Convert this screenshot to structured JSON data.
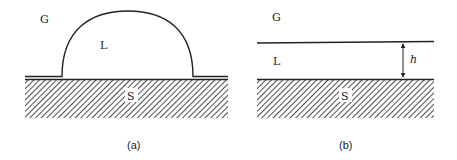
{
  "figure": {
    "panels": [
      {
        "id": "a",
        "caption": "(a)",
        "labels": {
          "gas": "G",
          "liquid": "L",
          "solid": "S"
        },
        "description": "Liquid droplet (L) sitting on a hatched solid substrate (S) in gas (G), with thin precursor film on either side"
      },
      {
        "id": "b",
        "caption": "(b)",
        "labels": {
          "gas": "G",
          "liquid": "L",
          "solid": "S",
          "thickness": "h"
        },
        "description": "Flat liquid film (L) of thickness h on a hatched solid substrate (S) in gas (G)"
      }
    ],
    "colors": {
      "line": "#222222",
      "background": "#ffffff"
    }
  }
}
